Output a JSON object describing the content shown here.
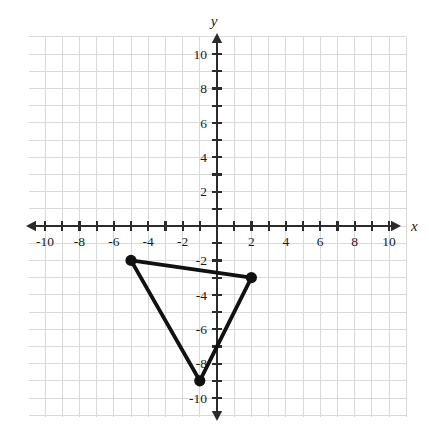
{
  "figure": {
    "background_color": "#ffffff",
    "axis_color": "#2b2b2b",
    "grid_color": "#d9d9d9",
    "shape_color": "#111111"
  },
  "axes": {
    "x_axis_name": "x",
    "y_axis_name": "y",
    "x_tick_labels": [
      "-10",
      "-8",
      "-6",
      "-4",
      "-2",
      "2",
      "4",
      "6",
      "8",
      "10"
    ],
    "y_tick_labels": [
      "10",
      "8",
      "6",
      "4",
      "2",
      "-2",
      "-4",
      "-6",
      "-8",
      "-10"
    ]
  },
  "chart_data": {
    "type": "scatter",
    "title": "",
    "xlabel": "x",
    "ylabel": "y",
    "xlim": [
      -11,
      11
    ],
    "ylim": [
      -11,
      11
    ],
    "x_ticks": [
      -10,
      -9,
      -8,
      -7,
      -6,
      -5,
      -4,
      -3,
      -2,
      -1,
      1,
      2,
      3,
      4,
      5,
      6,
      7,
      8,
      9,
      10
    ],
    "y_ticks": [
      -10,
      -9,
      -8,
      -7,
      -6,
      -5,
      -4,
      -3,
      -2,
      -1,
      1,
      2,
      3,
      4,
      5,
      6,
      7,
      8,
      9,
      10
    ],
    "x_tick_labels": [
      -10,
      -8,
      -6,
      -4,
      -2,
      2,
      4,
      6,
      8,
      10
    ],
    "y_tick_labels": [
      10,
      8,
      6,
      4,
      2,
      -2,
      -4,
      -6,
      -8,
      -10
    ],
    "grid": true,
    "grid_step": 1,
    "legend": false,
    "series": [
      {
        "name": "triangle",
        "kind": "polygon",
        "closed": true,
        "filled": false,
        "points": [
          {
            "label": "A",
            "x": -5,
            "y": -2
          },
          {
            "label": "B",
            "x": 2,
            "y": -3
          },
          {
            "label": "C",
            "x": -1,
            "y": -9
          }
        ]
      }
    ]
  },
  "geometry": {
    "origin_px": {
      "x": 217,
      "y": 226
    },
    "unit_px": 17.2,
    "grid_bounds_px": {
      "left": 29,
      "top": 37,
      "right": 406,
      "bottom": 417
    },
    "grid_bounds_units": {
      "xmin": -11,
      "xmax": 11,
      "ymin": -11,
      "ymax": 11
    }
  }
}
